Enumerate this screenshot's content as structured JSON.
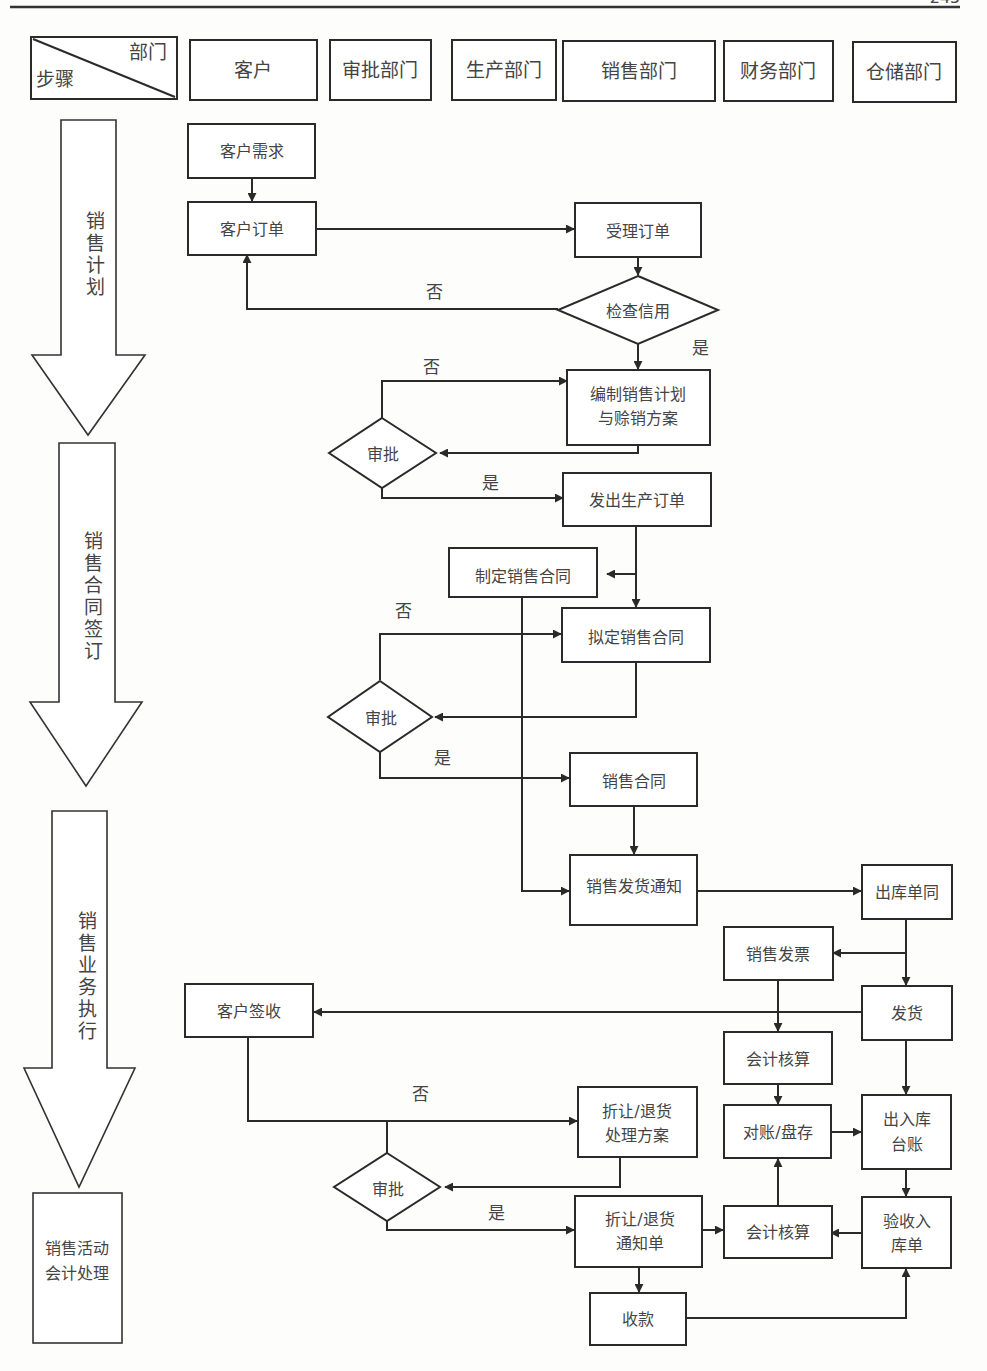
{
  "page": {
    "page_number": "245"
  },
  "header": {
    "corner": {
      "top_right": "部门",
      "bottom_left": "步骤"
    },
    "departments": [
      "客户",
      "审批部门",
      "生产部门",
      "销售部门",
      "财务部门",
      "仓储部门"
    ]
  },
  "stages": [
    {
      "label": "销售计划",
      "chars": [
        "销",
        "售",
        "计",
        "划"
      ]
    },
    {
      "label": "销售合同签订",
      "chars": [
        "销",
        "售",
        "合",
        "同",
        "签",
        "订"
      ]
    },
    {
      "label": "销售业务执行",
      "chars": [
        "销",
        "售",
        "业",
        "务",
        "执",
        "行"
      ]
    },
    {
      "label": "销售活动会计处理",
      "lines": [
        "销售活动",
        "会计处理"
      ]
    }
  ],
  "nodes": {
    "customer_demand": "客户需求",
    "customer_order": "客户订单",
    "accept_order": "受理订单",
    "check_credit": "检查信用",
    "sales_plan": [
      "编制销售计划",
      "与赊销方案"
    ],
    "approve_1": "审批",
    "issue_production_order": "发出生产订单",
    "make_contract": "制定销售合同",
    "draft_contract": "拟定销售合同",
    "approve_2": "审批",
    "sales_contract": "销售合同",
    "shipping_notice": "销售发货通知",
    "outbound_slip": "出库单同",
    "sales_invoice": "销售发票",
    "ship": "发货",
    "customer_sign": "客户签收",
    "accounting_1": "会计核算",
    "return_plan": [
      "折让/退货",
      "处理方案"
    ],
    "reconcile": "对账/盘存",
    "inout_ledger": [
      "出入库",
      "台账"
    ],
    "approve_3": "审批",
    "return_notice": [
      "折让/退货",
      "通知单"
    ],
    "accounting_2": "会计核算",
    "receipt_slip": [
      "验收入",
      "库单"
    ],
    "collection": "收款"
  },
  "edge_labels": {
    "no": "否",
    "yes": "是"
  }
}
